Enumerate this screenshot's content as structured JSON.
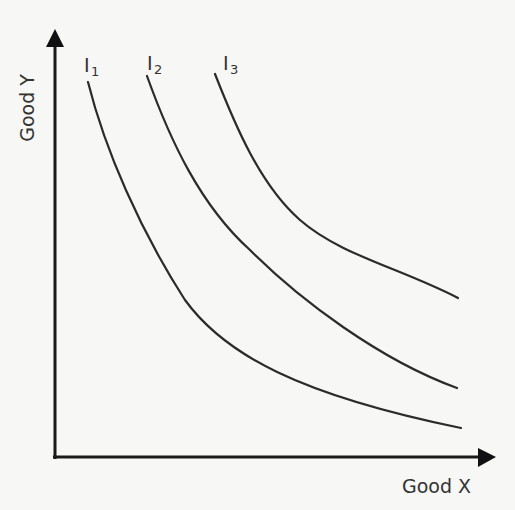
{
  "diagram": {
    "x_axis": {
      "label": "Good X"
    },
    "y_axis": {
      "label": "Good Y"
    },
    "curves": [
      {
        "id": "I1",
        "base": "I",
        "subscript": "1"
      },
      {
        "id": "I2",
        "base": "I",
        "subscript": "2"
      },
      {
        "id": "I3",
        "base": "I",
        "subscript": "3"
      }
    ],
    "colors": {
      "background": "#f7f7f5",
      "line": "#2b2b2b",
      "axis": "#1a1a1a",
      "text": "#333333"
    }
  }
}
